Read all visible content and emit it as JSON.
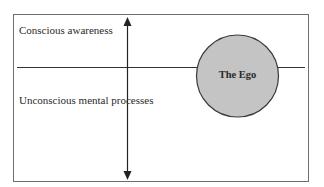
{
  "diagram": {
    "labels": {
      "conscious": "Conscious awareness",
      "unconscious": "Unconscious mental processes",
      "ego": "The Ego"
    },
    "colors": {
      "frame": "#6e6e6e",
      "line": "#333333",
      "arrow": "#222222",
      "ego_fill": "#c4c4c4",
      "ego_stroke": "#3a3a3a",
      "text": "#2a2a2a"
    },
    "geometry": {
      "frame": {
        "x": 13,
        "y": 14,
        "width": 296,
        "height": 168
      },
      "divider_y": 67,
      "arrow_x": 127,
      "arrow_top_y": 17,
      "arrow_bottom_y": 180,
      "ego_circle": {
        "cx": 237.5,
        "cy": 76,
        "r": 41
      }
    }
  }
}
